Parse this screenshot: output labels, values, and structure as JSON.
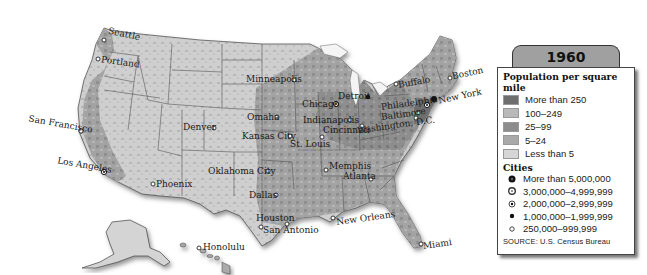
{
  "map": {
    "year_title": "1960",
    "region": "United States",
    "colors": {
      "more_than_250": "#6e6e6e",
      "100_249": "#b4b4b4",
      "25_99": "#8c8c8c",
      "5_24": "#a8a8a8",
      "less_than_5": "#d2d2d2",
      "water": "#ffffff",
      "border": "#4a4a4a"
    },
    "cities": [
      {
        "name": "Seattle",
        "x": 104,
        "y": 40
      },
      {
        "name": "Portland",
        "x": 98,
        "y": 59
      },
      {
        "name": "San Francisco",
        "x": 81,
        "y": 131
      },
      {
        "name": "Los Angeles",
        "x": 104,
        "y": 172
      },
      {
        "name": "Phoenix",
        "x": 153,
        "y": 184
      },
      {
        "name": "Denver",
        "x": 214,
        "y": 128
      },
      {
        "name": "Minneapolis",
        "x": 294,
        "y": 80
      },
      {
        "name": "Omaha",
        "x": 277,
        "y": 117
      },
      {
        "name": "Kansas City",
        "x": 290,
        "y": 136
      },
      {
        "name": "Oklahoma City",
        "x": 268,
        "y": 171
      },
      {
        "name": "Dallas",
        "x": 276,
        "y": 195
      },
      {
        "name": "Houston",
        "x": 287,
        "y": 224
      },
      {
        "name": "San Antonio",
        "x": 261,
        "y": 227
      },
      {
        "name": "St. Louis",
        "x": 322,
        "y": 137
      },
      {
        "name": "Chicago",
        "x": 336,
        "y": 104
      },
      {
        "name": "Detroit",
        "x": 368,
        "y": 97
      },
      {
        "name": "Indianapolis",
        "x": 350,
        "y": 120
      },
      {
        "name": "Cincinnati",
        "x": 362,
        "y": 126
      },
      {
        "name": "Memphis",
        "x": 326,
        "y": 170
      },
      {
        "name": "Atlanta",
        "x": 371,
        "y": 179
      },
      {
        "name": "New Orleans",
        "x": 333,
        "y": 218
      },
      {
        "name": "Miami",
        "x": 421,
        "y": 244
      },
      {
        "name": "Buffalo",
        "x": 396,
        "y": 84
      },
      {
        "name": "Boston",
        "x": 450,
        "y": 78
      },
      {
        "name": "New York",
        "x": 434,
        "y": 99
      },
      {
        "name": "Philadelphia",
        "x": 427,
        "y": 105
      },
      {
        "name": "Baltimore",
        "x": 418,
        "y": 113
      },
      {
        "name": "Washington, D.C.",
        "x": 416,
        "y": 118
      },
      {
        "name": "Honolulu",
        "x": 199,
        "y": 248
      }
    ]
  },
  "legend": {
    "population_heading": "Population per square mile",
    "density_classes": [
      {
        "label": "More than 250",
        "color": "#6e6e6e"
      },
      {
        "label": "100–249",
        "color": "#b9b9b9"
      },
      {
        "label": "25–99",
        "color": "#8c8c8c"
      },
      {
        "label": "5–24",
        "color": "#a9a9a9"
      },
      {
        "label": "Less than 5",
        "color": "#d6d6d6"
      }
    ],
    "cities_heading": "Cities",
    "city_classes": [
      {
        "label": "More than 5,000,000",
        "symbol": "large-filled-dot-icon"
      },
      {
        "label": "3,000,000–4,999,999",
        "symbol": "ring-dot-icon"
      },
      {
        "label": "2,000,000–2,999,999",
        "symbol": "bullseye-icon"
      },
      {
        "label": "1,000,000–1,999,999",
        "symbol": "small-filled-dot-icon"
      },
      {
        "label": "250,000–999,999",
        "symbol": "open-circle-icon"
      }
    ],
    "source": "SOURCE: U.S. Census Bureau"
  }
}
